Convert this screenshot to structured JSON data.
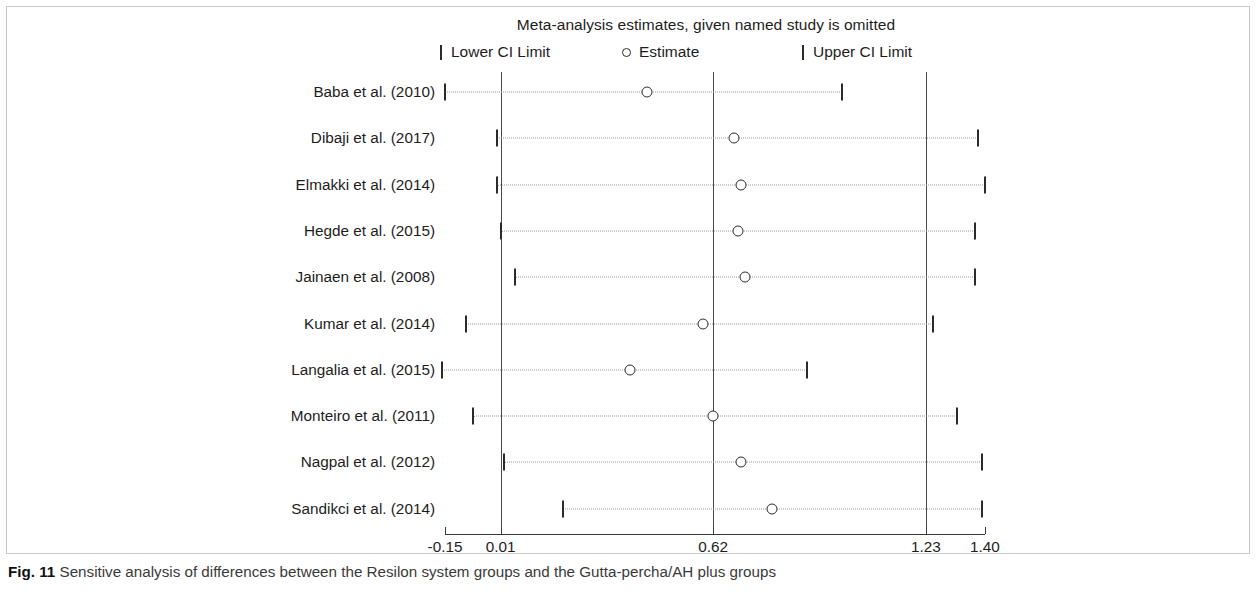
{
  "figure": {
    "caption_label": "Fig. 11",
    "caption_text": "Sensitive analysis of differences between the Resilon system groups and the Gutta-percha/AH plus groups"
  },
  "legend": {
    "lower_label": "Lower CI Limit",
    "estimate_label": "Estimate",
    "upper_label": "Upper CI Limit"
  },
  "chart_data": {
    "type": "scatter",
    "title": "Meta-analysis estimates, given named study is omitted",
    "xlabel": "",
    "ylabel": "",
    "xlim": [
      -0.15,
      1.4
    ],
    "grid": false,
    "legend_position": "top",
    "axis_reference_lines": [
      0.01,
      0.62,
      1.23
    ],
    "tick_values": [
      -0.15,
      0.01,
      0.62,
      1.23,
      1.4
    ],
    "tick_labels": [
      "-0.15",
      "0.01",
      "0.62",
      "1.23",
      "1.40"
    ],
    "categories": [
      "Baba et al. (2010)",
      "Dibaji et al. (2017)",
      "Elmakki et al. (2014)",
      "Hegde et al. (2015)",
      "Jainaen et al.  (2008)",
      "Kumar et al.  (2014)",
      "Langalia et al. (2015)",
      "Monteiro et al. (2011)",
      "Nagpal et al. (2012)",
      "Sandikci et al. (2014)"
    ],
    "series": [
      {
        "name": "Estimate",
        "values": [
          0.43,
          0.68,
          0.7,
          0.69,
          0.71,
          0.59,
          0.38,
          0.62,
          0.7,
          0.79
        ]
      },
      {
        "name": "Lower CI Limit",
        "values": [
          -0.15,
          0.0,
          0.0,
          0.01,
          0.05,
          -0.09,
          -0.16,
          -0.07,
          0.02,
          0.19
        ]
      },
      {
        "name": "Upper CI Limit",
        "values": [
          0.99,
          1.38,
          1.4,
          1.37,
          1.37,
          1.25,
          0.89,
          1.32,
          1.39,
          1.39
        ]
      }
    ]
  }
}
